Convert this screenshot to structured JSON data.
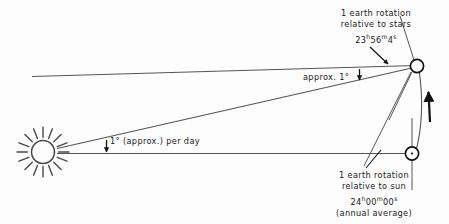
{
  "diagram": {
    "background_color": "#fdfdfd",
    "ink_color": "#1a1a1a",
    "line_color": "#555555",
    "labels": {
      "sidereal": {
        "line1": "1 earth rotation",
        "line2": "relative to stars",
        "duration_hours": "23",
        "duration_hours_unit": "h",
        "duration_minutes": "56",
        "duration_minutes_unit": "m",
        "duration_seconds": "4",
        "duration_seconds_unit": "s"
      },
      "solar": {
        "line1": "1 earth rotation",
        "line2": "relative to sun",
        "duration_hours": "24",
        "duration_hours_unit": "h",
        "duration_minutes": "00",
        "duration_minutes_unit": "m",
        "duration_seconds": "00",
        "duration_seconds_unit": "s",
        "line4": "(annual average)"
      },
      "approx_angle": "approx. 1°",
      "daily_angle": "1° (approx.) per day"
    },
    "objects": {
      "sun_name": "sun",
      "earth_upper_name": "earth-position-after-sidereal-day",
      "earth_lower_name": "earth-position-at-start",
      "orbit_direction": "counterclockwise-upward"
    }
  }
}
